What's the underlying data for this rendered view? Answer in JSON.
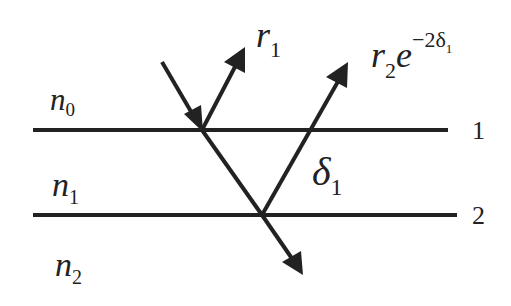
{
  "diagram": {
    "media": [
      {
        "symbol": "n",
        "sub": "0"
      },
      {
        "symbol": "n",
        "sub": "1"
      },
      {
        "symbol": "n",
        "sub": "2"
      }
    ],
    "interfaces": [
      {
        "label": "1"
      },
      {
        "label": "2"
      }
    ],
    "rays": {
      "r1": {
        "base": "r",
        "sub": "1"
      },
      "r2": {
        "base": "r",
        "sub": "2",
        "exp_base": "e",
        "exp": "−2δ",
        "exp_sub": "1"
      },
      "phase": {
        "symbol": "δ",
        "sub": "1"
      }
    },
    "colors": {
      "line": "#222222",
      "background": "#ffffff"
    }
  }
}
